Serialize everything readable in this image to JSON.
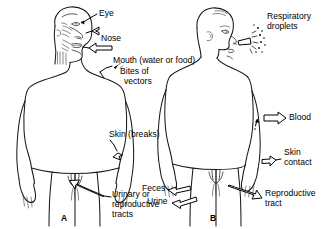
{
  "figure": {
    "background_color": "#ffffff",
    "line_color": "#1a1a1a"
  },
  "panels": [
    {
      "id": "A",
      "caption": "A",
      "view": "anterior",
      "theme": "portals-of-entry"
    },
    {
      "id": "B",
      "caption": "B",
      "view": "posterior",
      "theme": "portals-of-exit"
    }
  ],
  "labels_entry": {
    "eye": "Eye",
    "nose": "Nose",
    "mouth": "Mouth (water or food)",
    "bites_line1": "Bites of",
    "bites_line2": "vectors",
    "skin_breaks": "Skin (breaks)",
    "urogenital_line1": "Urinary or",
    "urogenital_line2": "reproductive",
    "urogenital_line3": "tracts"
  },
  "labels_exit": {
    "respiratory_line1": "Respiratory",
    "respiratory_line2": "droplets",
    "blood": "Blood",
    "skin_line1": "Skin",
    "skin_line2": "contact",
    "reproductive_line1": "Reproductive",
    "reproductive_line2": "tract",
    "feces": "Feces",
    "urine": "Urine"
  }
}
